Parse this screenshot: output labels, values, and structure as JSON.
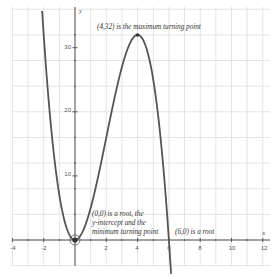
{
  "chart_data": {
    "type": "line",
    "title": "",
    "function": "y = -x^3 + 6x^2",
    "xlabel": "x",
    "ylabel": "y",
    "xlim": [
      -4,
      12.4
    ],
    "ylim": [
      -4,
      36.3
    ],
    "x_ticks": [
      -4,
      -2,
      2,
      4,
      6,
      8,
      10,
      12
    ],
    "y_ticks": [
      10,
      20,
      30
    ],
    "x_minor_step": 1,
    "y_grid_step": 4,
    "grid": true,
    "legend": null,
    "series": [
      {
        "name": "f(x) = -x^3 + 6x^2",
        "x": [
          -2.2,
          -2,
          -1.5,
          -1,
          -0.5,
          0,
          0.5,
          1,
          1.5,
          2,
          2.5,
          3,
          3.5,
          4,
          4.5,
          5,
          5.5,
          6,
          6.3
        ],
        "y": [
          39.7,
          32,
          16.9,
          7,
          1.6,
          0,
          1.4,
          5,
          10.1,
          16,
          21.9,
          27,
          30.6,
          32,
          30.4,
          25,
          15.1,
          0,
          -11.9
        ]
      }
    ],
    "points": [
      {
        "x": 0,
        "y": 0,
        "highlighted": true
      },
      {
        "x": 4,
        "y": 32,
        "highlighted": false
      }
    ],
    "annotations": [
      {
        "text": "(4,32) is the maximum turning point",
        "x": 4,
        "y": 32
      },
      {
        "text_lines": [
          "(0,0) is a root, the",
          "y-intercept and the",
          "minimum turning point"
        ],
        "x": 0,
        "y": 0
      },
      {
        "text": "(6,0) is a root",
        "x": 6,
        "y": 0
      }
    ]
  },
  "labels": {
    "x_axis": "x",
    "y_axis": "y",
    "x_ticks": [
      "-4",
      "-2",
      "2",
      "4",
      "6",
      "8",
      "10",
      "12"
    ],
    "y_ticks": [
      "10",
      "20",
      "30"
    ],
    "max_note": "(4,32) is the maximum turning point",
    "origin_note_1": "(0,0) is a root, the",
    "origin_note_2": "y-intercept and the",
    "origin_note_3": "minimum turning point",
    "root_note": "(6,0) is a root"
  },
  "colors": {
    "curve": "#555555",
    "grid": "#e4e4e4",
    "axis": "#555555"
  }
}
